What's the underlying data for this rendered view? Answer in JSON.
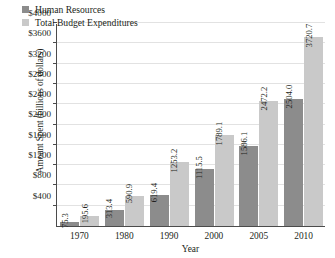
{
  "chart_data": {
    "type": "bar",
    "title": "",
    "xlabel": "Year",
    "ylabel": "Amount Spent (billions of dollars)",
    "categories": [
      "1970",
      "1980",
      "1990",
      "2000",
      "2005",
      "2010"
    ],
    "series": [
      {
        "name": "Human Resources",
        "color": "#8c8c8c",
        "values": [
          75.3,
          313.4,
          619.4,
          1115.5,
          1586.1,
          2504.0
        ],
        "labels": [
          "75.3",
          "313.4",
          "619.4",
          "1115.5",
          "1586.1",
          "2504.0"
        ]
      },
      {
        "name": "Total Budget Expenditures",
        "color": "#c9c9c9",
        "values": [
          195.6,
          590.9,
          1253.2,
          1789.1,
          2472.2,
          3720.7
        ],
        "labels": [
          "195.6",
          "590.9",
          "1253.2",
          "1789.1",
          "2472.2",
          "3720.7"
        ]
      }
    ],
    "ylim": [
      0,
      4000
    ],
    "ytick_values": [
      400,
      800,
      1200,
      1600,
      2000,
      2400,
      2800,
      3200,
      3600,
      4000
    ],
    "ytick_labels": [
      "$400",
      "$800",
      "$1200",
      "$1600",
      "$2000",
      "$2400",
      "$2800",
      "$3200",
      "$3600",
      "$4000"
    ],
    "grid": true,
    "legend_position": "top-left"
  },
  "legend": {
    "entries": [
      {
        "label": "Human Resources"
      },
      {
        "label": "Total Budget Expenditures"
      }
    ]
  }
}
